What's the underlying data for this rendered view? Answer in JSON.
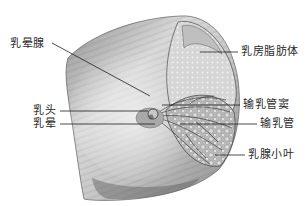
{
  "figure": {
    "colors": {
      "skin_light": "#e6e6e6",
      "skin_mid": "#bdbdbd",
      "skin_dark": "#7a7a7a",
      "tissue": "#d8d8d8",
      "line": "#1e1e1e",
      "text": "#2a2a2a"
    }
  },
  "labels": {
    "areolar_gland": "乳晕腺",
    "nipple": "乳头",
    "areola": "乳晕",
    "adipose_body": "乳房脂肪体",
    "lactiferous_sinus": "输乳管窦",
    "lactiferous_duct": "输乳管",
    "mammary_lobule": "乳腺小叶"
  }
}
